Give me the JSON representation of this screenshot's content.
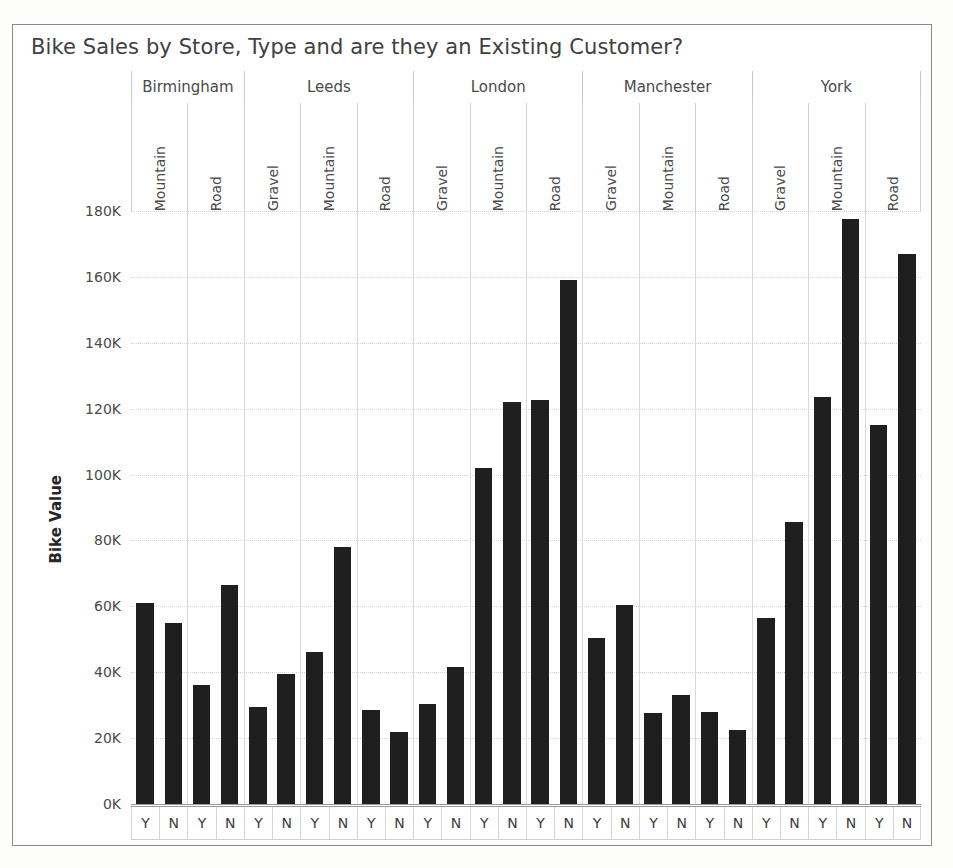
{
  "chart_title": "Bike Sales by Store, Type and are they an Existing Customer?",
  "axis": {
    "y_title": "Bike Value",
    "ticks": [
      "180K",
      "160K",
      "140K",
      "120K",
      "100K",
      "80K",
      "60K",
      "40K",
      "20K",
      "0K"
    ],
    "existing_yes": "Y",
    "existing_no": "N"
  },
  "chart_data": {
    "type": "bar",
    "title": "Bike Sales by Store, Type and are they an Existing Customer?",
    "xlabel": "",
    "ylabel": "Bike Value",
    "ylim": [
      0,
      180000
    ],
    "ytick_values": [
      0,
      20000,
      40000,
      60000,
      80000,
      100000,
      120000,
      140000,
      160000,
      180000
    ],
    "ytick_labels": [
      "0K",
      "20K",
      "40K",
      "60K",
      "80K",
      "100K",
      "120K",
      "140K",
      "160K",
      "180K"
    ],
    "grid": true,
    "legend": "none",
    "bar_color": "#1f1f1f",
    "hierarchy": [
      "Store",
      "Type",
      "Existing Customer"
    ],
    "stores": [
      "Birmingham",
      "Leeds",
      "London",
      "Manchester",
      "York"
    ],
    "existing_customer_levels": [
      "Y",
      "N"
    ],
    "groups": [
      {
        "store": "Birmingham",
        "types": [
          {
            "type": "Mountain",
            "Y": 61000,
            "N": 55000
          },
          {
            "type": "Road",
            "Y": 36000,
            "N": 66500
          }
        ]
      },
      {
        "store": "Leeds",
        "types": [
          {
            "type": "Gravel",
            "Y": 29500,
            "N": 39500
          },
          {
            "type": "Mountain",
            "Y": 46000,
            "N": 78000
          },
          {
            "type": "Road",
            "Y": 28500,
            "N": 22000
          }
        ]
      },
      {
        "store": "London",
        "types": [
          {
            "type": "Gravel",
            "Y": 30500,
            "N": 41500
          },
          {
            "type": "Mountain",
            "Y": 102000,
            "N": 122000
          },
          {
            "type": "Road",
            "Y": 122500,
            "N": 159000
          }
        ]
      },
      {
        "store": "Manchester",
        "types": [
          {
            "type": "Gravel",
            "Y": 50500,
            "N": 60500
          },
          {
            "type": "Mountain",
            "Y": 27500,
            "N": 33000
          },
          {
            "type": "Road",
            "Y": 28000,
            "N": 22500
          }
        ]
      },
      {
        "store": "York",
        "types": [
          {
            "type": "Gravel",
            "Y": 56500,
            "N": 85500
          },
          {
            "type": "Mountain",
            "Y": 123500,
            "N": 177500
          },
          {
            "type": "Road",
            "Y": 115000,
            "N": 167000
          }
        ]
      }
    ]
  }
}
